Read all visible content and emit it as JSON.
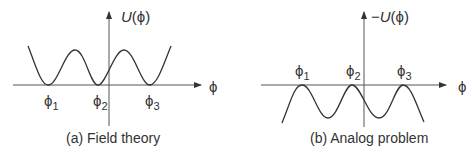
{
  "panels": [
    {
      "id": "a",
      "caption": "(a) Field theory",
      "y_axis_label_prefix": "",
      "y_axis_label_func": "U",
      "y_axis_label_arg": "(ϕ)",
      "x_axis_label": "ϕ",
      "points": [
        {
          "symbol": "ϕ",
          "sub": "1"
        },
        {
          "symbol": "ϕ",
          "sub": "2"
        },
        {
          "symbol": "ϕ",
          "sub": "3"
        }
      ]
    },
    {
      "id": "b",
      "caption": "(b) Analog problem",
      "y_axis_label_prefix": "−",
      "y_axis_label_func": "U",
      "y_axis_label_arg": "(ϕ)",
      "x_axis_label": "ϕ",
      "points": [
        {
          "symbol": "ϕ",
          "sub": "1"
        },
        {
          "symbol": "ϕ",
          "sub": "2"
        },
        {
          "symbol": "ϕ",
          "sub": "3"
        }
      ]
    }
  ],
  "colors": {
    "curve": "#333333",
    "axis": "#555555",
    "text": "#333333"
  }
}
